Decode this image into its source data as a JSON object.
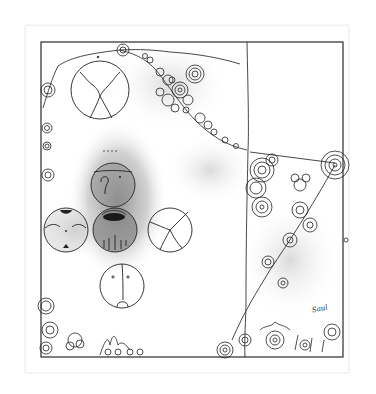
{
  "artwork": {
    "type": "pen-and-ink drawing with graphite shading",
    "signature": "Saul",
    "colors": {
      "paper": "#ffffff",
      "ink": "#1e1e1e",
      "shade": "#8a8a8a",
      "mat_edge": "#eeeeee"
    },
    "elements": [
      "border-frame",
      "vertical-divider",
      "diagonal-spiral-vine",
      "left-edge-spirals",
      "bottom-edge-spirals",
      "cracked-circle-top",
      "shaded-face-circle-upper",
      "ear-circle-left",
      "shaded-mouth-circle-center",
      "cracked-circle-right",
      "face-circle-bottom"
    ]
  }
}
